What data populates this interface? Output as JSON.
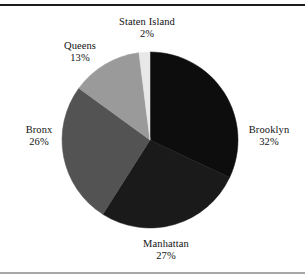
{
  "figure": {
    "frame": {
      "top_rule_color": "#1c1c1c",
      "bottom_rule_color": "#a8a8a8"
    }
  },
  "chart_data": {
    "type": "pie",
    "title": "",
    "subtitle": "",
    "xlabel": "",
    "ylabel": "",
    "legend_position": "none",
    "grid": false,
    "labels_outside": true,
    "start_angle_deg": 0,
    "direction": "clockwise",
    "center": {
      "x": 150,
      "y": 140
    },
    "radius": 88,
    "categories": [
      "Brooklyn",
      "Manhattan",
      "Bronx",
      "Queens",
      "Staten Island"
    ],
    "values": [
      32,
      27,
      26,
      13,
      2
    ],
    "value_suffix": "%",
    "colors": [
      "#0d0d0d",
      "#1a1a1a",
      "#535353",
      "#9a9a9a",
      "#e8e8e8"
    ],
    "slices": [
      {
        "name": "Brooklyn",
        "value": 32,
        "value_text": "32%",
        "color": "#0d0d0d"
      },
      {
        "name": "Manhattan",
        "value": 27,
        "value_text": "27%",
        "color": "#1a1a1a"
      },
      {
        "name": "Bronx",
        "value": 26,
        "value_text": "26%",
        "color": "#535353"
      },
      {
        "name": "Queens",
        "value": 13,
        "value_text": "13%",
        "color": "#9a9a9a"
      },
      {
        "name": "Staten Island",
        "value": 2,
        "value_text": "2%",
        "color": "#e8e8e8"
      }
    ]
  }
}
